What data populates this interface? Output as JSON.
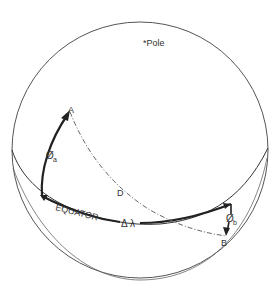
{
  "diagram": {
    "labels": {
      "pole": "*Pole",
      "point_a": "A",
      "point_b": "B",
      "equator": "EQUATOR",
      "distance": "D",
      "delta_lambda": "Δ λ",
      "phi_a": "Ø",
      "phi_a_sub": "a",
      "phi_b": "Ø",
      "phi_b_sub": "b"
    },
    "colors": {
      "line": "#333333",
      "outline": "#555555",
      "background": "#ffffff"
    }
  }
}
